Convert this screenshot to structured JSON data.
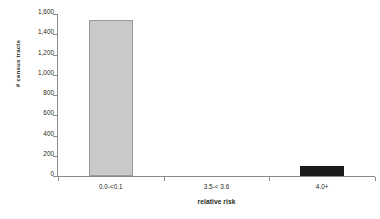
{
  "chart_data": {
    "type": "bar",
    "title": "",
    "xlabel": "relative risk",
    "ylabel": "# census tracts",
    "categories": [
      "0.0-<0.1",
      "3.5-< 3.6",
      "4.0+"
    ],
    "values": [
      1540,
      0,
      100
    ],
    "series": [
      {
        "name": "# census tracts",
        "values": [
          1540,
          0,
          100
        ]
      }
    ],
    "ylim": [
      0,
      1600
    ],
    "y_ticks": [
      0,
      200,
      400,
      600,
      800,
      1000,
      1200,
      1400,
      1600
    ],
    "y_tick_labels": [
      "0",
      "200",
      "400",
      "600",
      "800",
      "1,000",
      "1,200",
      "1,400",
      "1,600"
    ],
    "grid": false,
    "legend": "none",
    "bar_colors": [
      "#c9c9c9",
      "#c9c9c9",
      "#1a1a1a"
    ],
    "background_color": "#ffffff",
    "axis_color": "#8a8a8a",
    "text_color": "#231f20"
  }
}
